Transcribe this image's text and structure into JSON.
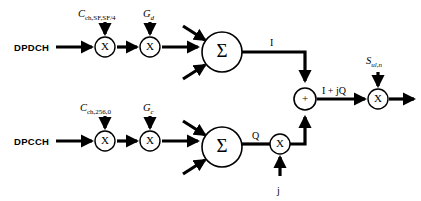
{
  "diagram": {
    "background_color": "#ffffff",
    "line_color": "#000000",
    "width": 421,
    "height": 201
  },
  "inputs": [
    {
      "id": "dpdch",
      "label": "DPDCH",
      "branch": "I"
    },
    {
      "id": "dpcch",
      "label": "DPCCH",
      "branch": "Q"
    }
  ],
  "channelization_codes": [
    {
      "id": "c-ch-sf",
      "base": "C",
      "subscript": "ch,SF,SF/4",
      "branch": "I"
    },
    {
      "id": "c-ch-256",
      "base": "C",
      "subscript": "ch,256,0",
      "branch": "Q"
    }
  ],
  "gains": [
    {
      "id": "gain-d",
      "base": "G",
      "subscript": "d",
      "branch": "I"
    },
    {
      "id": "gain-c",
      "base": "G",
      "subscript": "c",
      "branch": "Q"
    }
  ],
  "operators": {
    "multiply_glyph": "X",
    "sum_glyph": "Σ",
    "add_glyph": "+"
  },
  "signals": {
    "i_branch": "I",
    "q_branch": "Q",
    "imaginary_unit": "j",
    "complex": "I + jQ"
  },
  "scrambling": {
    "id": "s-ul-n",
    "base": "S",
    "subscript": "ul,n"
  },
  "nodes": {
    "mult_i_code": {
      "x": 105,
      "y": 47,
      "r": 10,
      "glyph": "X"
    },
    "mult_i_gain": {
      "x": 150,
      "y": 47,
      "r": 10,
      "glyph": "X"
    },
    "sum_i": {
      "x": 222,
      "y": 52,
      "r": 20,
      "glyph": "Σ"
    },
    "mult_q_code": {
      "x": 105,
      "y": 141,
      "r": 10,
      "glyph": "X"
    },
    "mult_q_gain": {
      "x": 150,
      "y": 141,
      "r": 10,
      "glyph": "X"
    },
    "sum_q": {
      "x": 222,
      "y": 147,
      "r": 20,
      "glyph": "Σ"
    },
    "mult_j": {
      "x": 280,
      "y": 144,
      "r": 10,
      "glyph": "X"
    },
    "adder": {
      "x": 305,
      "y": 99,
      "r": 11,
      "glyph": "+"
    },
    "mult_scram": {
      "x": 378,
      "y": 99,
      "r": 10,
      "glyph": "X"
    }
  }
}
